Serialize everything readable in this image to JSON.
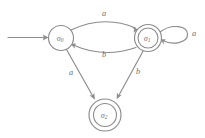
{
  "diagram": {
    "type": "finite-state-automaton",
    "title": "",
    "background_color": "#ffffff",
    "stroke_color": "#8c8c8c",
    "text_color": "#6e6e6e",
    "alphabet": [
      "a",
      "b"
    ],
    "start_state": "sigma_0",
    "accepting_states": [
      "sigma_1",
      "sigma_2"
    ],
    "states": [
      {
        "id": "sigma_0",
        "base": "σ",
        "subscript": "0",
        "label": "σ₀",
        "accepting": false,
        "cx": 61,
        "cy": 38,
        "r": 12.5
      },
      {
        "id": "sigma_1",
        "base": "σ",
        "subscript": "1",
        "label": "σ₁",
        "accepting": true,
        "cx": 148,
        "cy": 38,
        "r": 13.5,
        "inner_r": 10.0
      },
      {
        "id": "sigma_2",
        "base": "σ",
        "subscript": "2",
        "label": "σ₂",
        "accepting": true,
        "cx": 105,
        "cy": 115,
        "r": 16.0,
        "inner_r": 11.5
      }
    ],
    "transitions": [
      {
        "id": "t0",
        "from": "sigma_0",
        "to": "sigma_1",
        "symbol": "a",
        "shape": "curve-top",
        "label_x": 104,
        "label_y": 13
      },
      {
        "id": "t1",
        "from": "sigma_1",
        "to": "sigma_0",
        "symbol": "b",
        "shape": "curve-bottom",
        "label_x": 104,
        "label_y": 54
      },
      {
        "id": "t2",
        "from": "sigma_0",
        "to": "sigma_2",
        "symbol": "a",
        "shape": "straight",
        "label_x": 71,
        "label_y": 72
      },
      {
        "id": "t3",
        "from": "sigma_1",
        "to": "sigma_2",
        "symbol": "b",
        "shape": "straight",
        "label_x": 138,
        "label_y": 71
      },
      {
        "id": "t4",
        "from": "sigma_1",
        "to": "sigma_1",
        "symbol": "a",
        "shape": "self-loop-right",
        "label_x": 194,
        "label_y": 33
      }
    ],
    "start_arrow": {
      "id": "start",
      "label": "",
      "from_x": 8,
      "from_y": 37.5,
      "to_x": 48,
      "to_y": 37.5
    }
  }
}
